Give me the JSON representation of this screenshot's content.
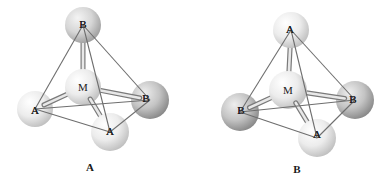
{
  "figures": [
    {
      "id": "A",
      "caption": "A",
      "caption_pos": [
        90,
        167
      ],
      "center": {
        "label": "M",
        "pos": [
          83,
          87
        ],
        "r": 18,
        "shade": "light"
      },
      "vertices": [
        {
          "key": "top",
          "label": "B",
          "pos": [
            83,
            25
          ],
          "label_pos": [
            83,
            24
          ],
          "r": 18,
          "shade": "medium"
        },
        {
          "key": "left",
          "label": "A",
          "pos": [
            35,
            109
          ],
          "label_pos": [
            35,
            110
          ],
          "r": 18,
          "shade": "light"
        },
        {
          "key": "right",
          "label": "B",
          "pos": [
            150,
            100
          ],
          "label_pos": [
            146,
            98
          ],
          "r": 19,
          "shade": "dark"
        },
        {
          "key": "front",
          "label": "A",
          "pos": [
            110,
            132
          ],
          "label_pos": [
            110,
            131
          ],
          "r": 19,
          "shade": "light"
        }
      ]
    },
    {
      "id": "B",
      "caption": "B",
      "caption_pos": [
        297,
        169
      ],
      "center": {
        "label": "M",
        "pos": [
          288,
          90
        ],
        "r": 19,
        "shade": "light"
      },
      "vertices": [
        {
          "key": "top",
          "label": "A",
          "pos": [
            291,
            30
          ],
          "label_pos": [
            290,
            29
          ],
          "r": 18,
          "shade": "light"
        },
        {
          "key": "left",
          "label": "B",
          "pos": [
            240,
            112
          ],
          "label_pos": [
            241,
            110
          ],
          "r": 19,
          "shade": "dark"
        },
        {
          "key": "right",
          "label": "B",
          "pos": [
            355,
            100
          ],
          "label_pos": [
            353,
            99
          ],
          "r": 19,
          "shade": "dark"
        },
        {
          "key": "front",
          "label": "A",
          "pos": [
            317,
            138
          ],
          "label_pos": [
            317,
            134
          ],
          "r": 19,
          "shade": "light"
        }
      ]
    }
  ],
  "edges": [
    [
      "top",
      "left"
    ],
    [
      "top",
      "right"
    ],
    [
      "top",
      "front"
    ],
    [
      "left",
      "right"
    ],
    [
      "left",
      "front"
    ],
    [
      "right",
      "front"
    ]
  ],
  "colors": {
    "light": {
      "hi": "#ffffff",
      "mid": "#ececec",
      "lo": "#bdbdbd"
    },
    "medium": {
      "hi": "#f4f4f4",
      "mid": "#d6d6d6",
      "lo": "#9c9c9c"
    },
    "dark": {
      "hi": "#eeeeee",
      "mid": "#c4c4c4",
      "lo": "#858585"
    }
  }
}
